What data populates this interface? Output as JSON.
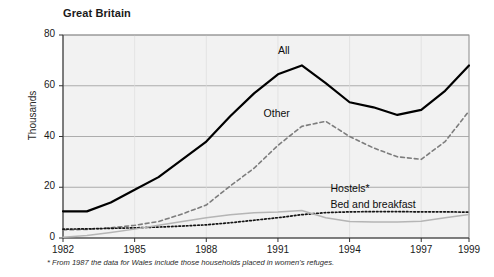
{
  "figure": {
    "title": "Great Britain",
    "footnote": "* From 1987 the data for Wales include those households placed in women's refuges.",
    "y_axis_title": "Thousands"
  },
  "chart_data": {
    "type": "line",
    "title": "Great Britain",
    "xlabel": "",
    "ylabel": "Thousands",
    "xlim": [
      1982,
      1999
    ],
    "ylim": [
      0,
      80
    ],
    "yticks": [
      0,
      20,
      40,
      60,
      80
    ],
    "xticks": [
      1982,
      1985,
      1988,
      1991,
      1994,
      1997,
      1999
    ],
    "xtick_labels": [
      "1982",
      "1985",
      "1988",
      "1991",
      "1994",
      "1997",
      "1999"
    ],
    "ytick_labels": [
      "0",
      "20",
      "40",
      "60",
      "80"
    ],
    "grid": "horizontal",
    "legend_position": "inline-labels",
    "plot_background": "#f2f2f2",
    "x": [
      1982,
      1983,
      1984,
      1985,
      1986,
      1987,
      1988,
      1989,
      1990,
      1991,
      1992,
      1993,
      1994,
      1995,
      1996,
      1997,
      1998,
      1999
    ],
    "series": [
      {
        "name": "All",
        "style": "solid",
        "color": "#000000",
        "width": 2.2,
        "label_x": 1991.0,
        "label_y": 73.5,
        "values": [
          10.5,
          10.5,
          14.0,
          19.0,
          24.0,
          31.0,
          38.0,
          48.0,
          57.0,
          64.5,
          68.0,
          61.0,
          53.5,
          51.5,
          48.5,
          50.5,
          58.0,
          68.0
        ]
      },
      {
        "name": "Other",
        "style": "dashed",
        "color": "#7d7d7d",
        "width": 1.6,
        "label_x": 1990.4,
        "label_y": 49.0,
        "values": [
          3.2,
          3.4,
          4.0,
          5.0,
          6.5,
          9.5,
          13.0,
          20.5,
          27.5,
          36.5,
          44.0,
          46.0,
          40.0,
          35.5,
          32.0,
          31.0,
          38.0,
          50.0
        ]
      },
      {
        "name": "Hostels*",
        "style": "dotted",
        "color": "#151515",
        "width": 1.7,
        "label_x": 1993.2,
        "label_y": 19.5,
        "values": [
          3.5,
          3.6,
          3.8,
          4.0,
          4.3,
          4.7,
          5.2,
          6.0,
          7.0,
          8.0,
          9.2,
          10.0,
          10.3,
          10.4,
          10.4,
          10.3,
          10.3,
          10.2
        ]
      },
      {
        "name": "Bed and breakfast",
        "style": "solid",
        "color": "#b5b5b5",
        "width": 1.5,
        "label_x": 1993.2,
        "label_y": 13.0,
        "values": [
          0.3,
          1.0,
          2.2,
          3.5,
          5.0,
          6.5,
          8.0,
          9.2,
          10.0,
          10.2,
          10.8,
          8.0,
          6.5,
          6.3,
          6.3,
          6.6,
          8.0,
          9.3
        ]
      }
    ]
  },
  "axes": {
    "ytick_labels": [
      "80",
      "60",
      "40",
      "20",
      "0"
    ],
    "xtick_labels": [
      "1982",
      "1985",
      "1988",
      "1991",
      "1994",
      "1997",
      "1999"
    ]
  }
}
